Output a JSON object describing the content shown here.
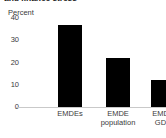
{
  "chart_data": {
    "type": "bar",
    "title": "and finance stress",
    "title_clipped": true,
    "ylabel": "Percent",
    "xlabel": "",
    "categories": [
      "EMDEs",
      "EMDE population",
      "EMDE GDP"
    ],
    "values": [
      37,
      22,
      12
    ],
    "ylim": [
      0,
      40
    ],
    "yticks": [
      0,
      10,
      20,
      30,
      40
    ],
    "ytick_labels": [
      "0",
      "10",
      "20",
      "30",
      "40"
    ],
    "grid": false,
    "legend": null,
    "bar_color": "#000000",
    "axis_color": "#c9c9c9",
    "text_color": "#3a3a3a"
  },
  "category_lines": [
    [
      "EMDEs"
    ],
    [
      "EMDE",
      "population"
    ],
    [
      "EMDE",
      "GDP"
    ]
  ]
}
